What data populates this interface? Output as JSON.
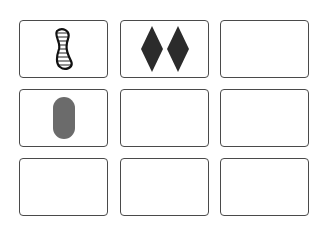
{
  "board": {
    "rows": 3,
    "cols": 3,
    "cards": [
      {
        "position": "r1c1",
        "count": 1,
        "shape": "squiggle",
        "shading": "striped",
        "color": "#222222"
      },
      {
        "position": "r1c2",
        "count": 2,
        "shape": "diamond",
        "shading": "solid",
        "color": "#2b2b2b"
      },
      {
        "position": "r1c3",
        "empty": true
      },
      {
        "position": "r2c1",
        "count": 1,
        "shape": "oval",
        "shading": "solid",
        "color": "#6b6b6b"
      },
      {
        "position": "r2c2",
        "empty": true
      },
      {
        "position": "r2c3",
        "empty": true
      },
      {
        "position": "r3c1",
        "empty": true
      },
      {
        "position": "r3c2",
        "empty": true
      },
      {
        "position": "r3c3",
        "empty": true
      }
    ]
  }
}
